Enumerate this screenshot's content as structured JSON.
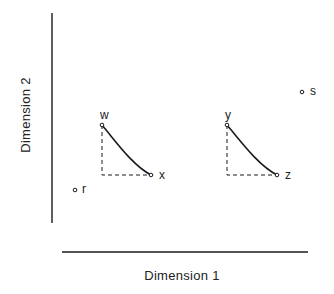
{
  "diagram": {
    "x_axis": {
      "label": "Dimension 1",
      "x1": 62,
      "x2": 308,
      "y": 252
    },
    "y_axis": {
      "label": "Dimension 2",
      "x": 52,
      "y1": 13,
      "y2": 223
    },
    "colors": {
      "ink": "#1a1a1a",
      "background": "#ffffff"
    },
    "points": [
      {
        "id": "w",
        "label": "w",
        "x": 102,
        "y": 125,
        "label_dx": -2,
        "label_dy": -16
      },
      {
        "id": "x",
        "label": "x",
        "x": 151,
        "y": 175,
        "label_dx": 8,
        "label_dy": -6
      },
      {
        "id": "y",
        "label": "y",
        "x": 227,
        "y": 125,
        "label_dx": -2,
        "label_dy": -16
      },
      {
        "id": "z",
        "label": "z",
        "x": 277,
        "y": 175,
        "label_dx": 8,
        "label_dy": -6
      },
      {
        "id": "r",
        "label": "r",
        "x": 75,
        "y": 190,
        "label_dx": 7,
        "label_dy": -7
      },
      {
        "id": "s",
        "label": "s",
        "x": 302,
        "y": 92,
        "label_dx": 8,
        "label_dy": -7
      }
    ],
    "curves": [
      {
        "name": "curve-w-to-x",
        "from": "w",
        "to": "x"
      },
      {
        "name": "curve-y-to-z",
        "from": "y",
        "to": "z"
      }
    ],
    "dashed_corners": [
      {
        "name": "dashed-corner-wx",
        "from": "w",
        "to": "x"
      },
      {
        "name": "dashed-corner-yz",
        "from": "y",
        "to": "z"
      }
    ]
  }
}
